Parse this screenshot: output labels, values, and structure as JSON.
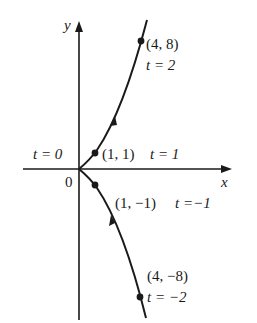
{
  "diagram": {
    "axes": {
      "x_label": "x",
      "y_label": "y",
      "origin_label": "0"
    },
    "points": [
      {
        "coord": "(4, 8)",
        "param": "t = 2"
      },
      {
        "coord": "(1, 1)",
        "param": "t = 1"
      },
      {
        "coord": "(1, −1)",
        "param": "t =−1"
      },
      {
        "coord": "(4, −8)",
        "param": "t = −2"
      }
    ],
    "t_zero_label": "t = 0",
    "colors": {
      "ink": "#1a1a1a",
      "background": "#ffffff"
    }
  }
}
